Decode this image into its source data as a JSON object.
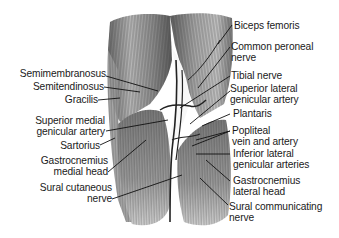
{
  "diagram": {
    "colors": {
      "background": "#ffffff",
      "text": "#1a1a1a",
      "muscle_dark": "#3a3a3a",
      "muscle_light": "#d8d8d8",
      "leader": "#111111"
    },
    "labels_left": [
      {
        "id": "semimembranosus",
        "lines": [
          "Semimembranosus"
        ]
      },
      {
        "id": "semitendinosus",
        "lines": [
          "Semitendinosus"
        ]
      },
      {
        "id": "gracilis",
        "lines": [
          "Gracilis"
        ]
      },
      {
        "id": "superior-medial-genicular-artery",
        "lines": [
          "Superior medial",
          "genicular artery"
        ]
      },
      {
        "id": "sartorius",
        "lines": [
          "Sartorius"
        ]
      },
      {
        "id": "gastrocnemius-medial-head",
        "lines": [
          "Gastrocnemius",
          "medial head"
        ]
      },
      {
        "id": "sural-cutaneous-nerve",
        "lines": [
          "Sural cutaneous",
          "nerve"
        ]
      }
    ],
    "labels_right": [
      {
        "id": "biceps-femoris",
        "lines": [
          "Biceps femoris"
        ]
      },
      {
        "id": "common-peroneal-nerve",
        "lines": [
          "Common peroneal",
          "nerve"
        ]
      },
      {
        "id": "tibial-nerve",
        "lines": [
          "Tibial nerve"
        ]
      },
      {
        "id": "superior-lateral-genicular-artery",
        "lines": [
          "Superior lateral",
          "genicular artery"
        ]
      },
      {
        "id": "plantaris",
        "lines": [
          "Plantaris"
        ]
      },
      {
        "id": "popliteal-vein-and-artery",
        "lines": [
          "Popliteal",
          "vein and artery"
        ]
      },
      {
        "id": "inferior-lateral-genicular-arteries",
        "lines": [
          "Inferior lateral",
          "genicular arteries"
        ]
      },
      {
        "id": "gastrocnemius-lateral-head",
        "lines": [
          "Gastrocnemius",
          "lateral head"
        ]
      },
      {
        "id": "sural-communicating-nerve",
        "lines": [
          "Sural communicating",
          "nerve"
        ]
      }
    ]
  }
}
